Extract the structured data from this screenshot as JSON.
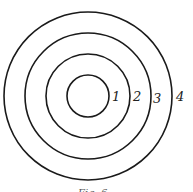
{
  "figure": {
    "rings": [
      {
        "label": "1"
      },
      {
        "label": "2"
      },
      {
        "label": "3"
      },
      {
        "label": "4"
      }
    ],
    "caption": "Fig. 6"
  }
}
